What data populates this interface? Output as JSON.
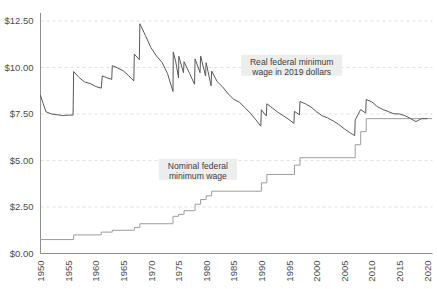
{
  "chart_data": {
    "type": "line",
    "title": "",
    "subtitle": "",
    "xlabel": "",
    "ylabel": "",
    "xlim": [
      1950,
      2021
    ],
    "ylim": [
      0,
      12.5
    ],
    "grid": true,
    "legend_position": "inline-annotations",
    "y_ticks": [
      {
        "value": 0,
        "label": "$0.00"
      },
      {
        "value": 2.5,
        "label": "$2.50"
      },
      {
        "value": 5,
        "label": "$5.00"
      },
      {
        "value": 7.5,
        "label": "$7.50"
      },
      {
        "value": 10,
        "label": "$10.00"
      },
      {
        "value": 12.5,
        "label": "$12.50"
      }
    ],
    "x_ticks": [
      {
        "value": 1950,
        "label": "1950"
      },
      {
        "value": 1955,
        "label": "1955"
      },
      {
        "value": 1960,
        "label": "1960"
      },
      {
        "value": 1965,
        "label": "1965"
      },
      {
        "value": 1970,
        "label": "1970"
      },
      {
        "value": 1975,
        "label": "1975"
      },
      {
        "value": 1980,
        "label": "1980"
      },
      {
        "value": 1985,
        "label": "1985"
      },
      {
        "value": 1990,
        "label": "1990"
      },
      {
        "value": 1995,
        "label": "1995"
      },
      {
        "value": 2000,
        "label": "2000"
      },
      {
        "value": 2005,
        "label": "2005"
      },
      {
        "value": 2010,
        "label": "2010"
      },
      {
        "value": 2015,
        "label": "2015"
      },
      {
        "value": 2020,
        "label": "2020"
      }
    ],
    "annotations": [
      {
        "id": "real-series-label",
        "text_line_1": "Real federal minimum",
        "text_line_2": "wage in 2019 dollars",
        "x": 1995.5,
        "y": 10.15
      },
      {
        "id": "nominal-series-label",
        "text_line_1": "Nominal federal",
        "text_line_2": "minimum wage",
        "x": 1978.5,
        "y": 4.55
      }
    ],
    "series": [
      {
        "name": "Real federal minimum wage in 2019 dollars",
        "color": "#58595b",
        "points": [
          [
            1950,
            8.5
          ],
          [
            1950.5,
            8.05
          ],
          [
            1951,
            7.62
          ],
          [
            1952,
            7.5
          ],
          [
            1953,
            7.46
          ],
          [
            1954,
            7.42
          ],
          [
            1955,
            7.44
          ],
          [
            1955.9,
            7.44
          ],
          [
            1956,
            9.78
          ],
          [
            1957,
            9.46
          ],
          [
            1958,
            9.22
          ],
          [
            1959,
            9.14
          ],
          [
            1960,
            8.98
          ],
          [
            1961,
            8.89
          ],
          [
            1961.2,
            9.55
          ],
          [
            1962,
            9.45
          ],
          [
            1962.9,
            9.36
          ],
          [
            1963,
            10.1
          ],
          [
            1964,
            9.97
          ],
          [
            1965,
            9.82
          ],
          [
            1966,
            9.55
          ],
          [
            1966.9,
            9.28
          ],
          [
            1967,
            10.72
          ],
          [
            1967.9,
            10.42
          ],
          [
            1968,
            12.35
          ],
          [
            1969,
            11.72
          ],
          [
            1970,
            11.07
          ],
          [
            1971,
            10.62
          ],
          [
            1972,
            10.28
          ],
          [
            1973,
            9.68
          ],
          [
            1974,
            8.71
          ],
          [
            1974.05,
            10.84
          ],
          [
            1974.5,
            10.3
          ],
          [
            1975,
            9.44
          ],
          [
            1975.05,
            10.6
          ],
          [
            1975.9,
            9.72
          ],
          [
            1976,
            10.31
          ],
          [
            1977,
            9.68
          ],
          [
            1977.9,
            9.1
          ],
          [
            1978,
            10.46
          ],
          [
            1978.9,
            9.72
          ],
          [
            1979,
            10.62
          ],
          [
            1979.9,
            9.54
          ],
          [
            1980,
            10.26
          ],
          [
            1980.9,
            9.02
          ],
          [
            1981,
            9.81
          ],
          [
            1982,
            9.24
          ],
          [
            1983,
            8.95
          ],
          [
            1984,
            8.58
          ],
          [
            1985,
            8.29
          ],
          [
            1986,
            8.14
          ],
          [
            1987,
            7.85
          ],
          [
            1988,
            7.54
          ],
          [
            1989,
            7.19
          ],
          [
            1989.9,
            6.85
          ],
          [
            1990,
            7.73
          ],
          [
            1990.9,
            7.39
          ],
          [
            1991,
            8.05
          ],
          [
            1992,
            7.82
          ],
          [
            1993,
            7.59
          ],
          [
            1994,
            7.4
          ],
          [
            1995,
            7.2
          ],
          [
            1995.9,
            7.0
          ],
          [
            1996,
            7.64
          ],
          [
            1996.9,
            7.46
          ],
          [
            1997,
            8.17
          ],
          [
            1998,
            8.05
          ],
          [
            1999,
            7.87
          ],
          [
            2000,
            7.62
          ],
          [
            2001,
            7.41
          ],
          [
            2002,
            7.29
          ],
          [
            2003,
            7.13
          ],
          [
            2004,
            6.94
          ],
          [
            2005,
            6.71
          ],
          [
            2006,
            6.5
          ],
          [
            2006.9,
            6.34
          ],
          [
            2007,
            7.18
          ],
          [
            2008,
            7.74
          ],
          [
            2008.9,
            7.55
          ],
          [
            2009,
            8.28
          ],
          [
            2010,
            8.15
          ],
          [
            2011,
            7.9
          ],
          [
            2012,
            7.74
          ],
          [
            2013,
            7.63
          ],
          [
            2014,
            7.51
          ],
          [
            2015,
            7.5
          ],
          [
            2016,
            7.41
          ],
          [
            2017,
            7.26
          ],
          [
            2018,
            7.09
          ],
          [
            2019,
            7.25
          ],
          [
            2020,
            7.25
          ]
        ]
      },
      {
        "name": "Nominal federal minimum wage",
        "color": "#9b9c9e",
        "step": true,
        "points": [
          [
            1950,
            0.75
          ],
          [
            1955.9,
            0.75
          ],
          [
            1956,
            1.0
          ],
          [
            1960.9,
            1.0
          ],
          [
            1961,
            1.15
          ],
          [
            1962.9,
            1.15
          ],
          [
            1963,
            1.25
          ],
          [
            1966.9,
            1.25
          ],
          [
            1967,
            1.4
          ],
          [
            1967.9,
            1.4
          ],
          [
            1968,
            1.6
          ],
          [
            1973.9,
            1.6
          ],
          [
            1974,
            2.0
          ],
          [
            1974.9,
            2.0
          ],
          [
            1975,
            2.1
          ],
          [
            1975.9,
            2.1
          ],
          [
            1976,
            2.3
          ],
          [
            1977.9,
            2.3
          ],
          [
            1978,
            2.65
          ],
          [
            1978.9,
            2.65
          ],
          [
            1979,
            2.9
          ],
          [
            1979.9,
            2.9
          ],
          [
            1980,
            3.1
          ],
          [
            1980.9,
            3.1
          ],
          [
            1981,
            3.35
          ],
          [
            1989.9,
            3.35
          ],
          [
            1990,
            3.8
          ],
          [
            1990.9,
            3.8
          ],
          [
            1991,
            4.25
          ],
          [
            1995.9,
            4.25
          ],
          [
            1996,
            4.75
          ],
          [
            1996.9,
            4.75
          ],
          [
            1997,
            5.15
          ],
          [
            2006.9,
            5.15
          ],
          [
            2007,
            5.85
          ],
          [
            2007.9,
            5.85
          ],
          [
            2008,
            6.55
          ],
          [
            2008.9,
            6.55
          ],
          [
            2009,
            7.25
          ],
          [
            2020.9,
            7.25
          ]
        ]
      }
    ]
  }
}
